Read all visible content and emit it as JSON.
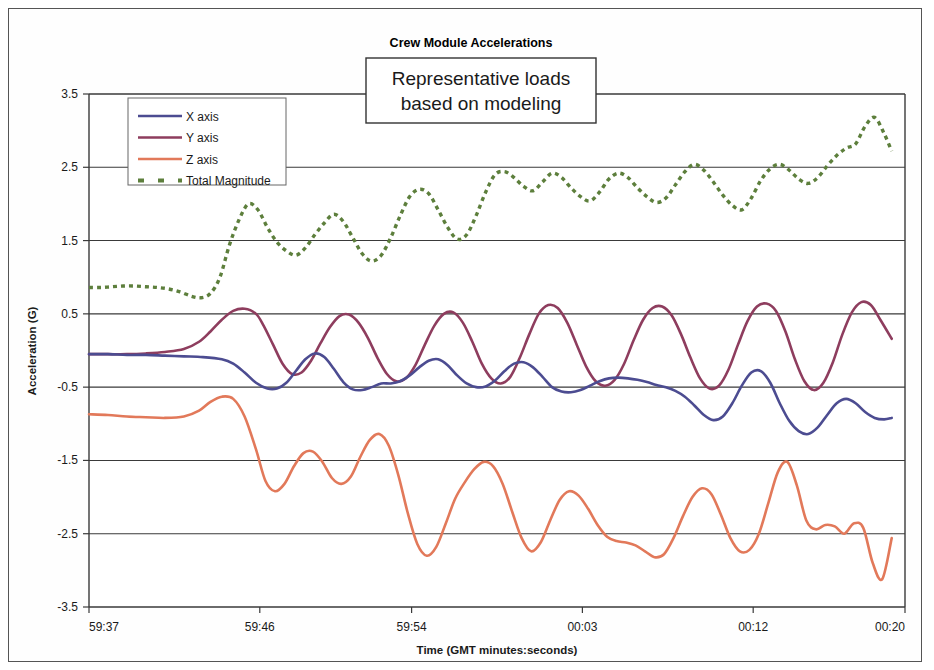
{
  "chart_data": {
    "type": "line",
    "title": "Crew Module Accelerations",
    "annotation": {
      "line1": "Representative loads",
      "line2": "based on modeling"
    },
    "xlabel": "Time (GMT minutes:seconds)",
    "ylabel": "Acceleration (G)",
    "ylim": [
      -3.5,
      3.5
    ],
    "ytick_labels": [
      "3.5",
      "2.5",
      "1.5",
      "0.5",
      "-0.5",
      "-1.5",
      "-2.5",
      "-3.5"
    ],
    "ytick_values": [
      3.5,
      2.5,
      1.5,
      0.5,
      -0.5,
      -1.5,
      -2.5,
      -3.5
    ],
    "xtick_labels": [
      "59:37",
      "59:46",
      "59:54",
      "00:03",
      "00:12",
      "00:20"
    ],
    "xtick_values": [
      0,
      9,
      17,
      26,
      35,
      43
    ],
    "xlim": [
      0,
      43
    ],
    "grid": true,
    "legend_position": "top-left-inside",
    "colors": {
      "x_axis": "#4c4c91",
      "y_axis": "#8e3d5e",
      "z_axis": "#e2795a",
      "total_magnitude": "#5d7f3c",
      "gridline": "#3a3a3a",
      "background": "#ffffff"
    },
    "series": [
      {
        "name": "X axis",
        "color": "#4c4c91",
        "style": "solid",
        "x": [
          0.0,
          1.0,
          2.0,
          3.0,
          4.0,
          5.0,
          6.0,
          7.0,
          7.6,
          8.2,
          8.8,
          9.4,
          9.9,
          10.4,
          10.9,
          11.4,
          11.9,
          12.4,
          12.9,
          13.4,
          13.9,
          14.4,
          14.9,
          15.4,
          15.9,
          16.4,
          16.9,
          17.4,
          17.9,
          18.4,
          18.9,
          19.4,
          19.9,
          20.4,
          20.9,
          21.4,
          21.9,
          22.4,
          22.9,
          23.4,
          23.9,
          24.4,
          24.9,
          25.4,
          25.9,
          26.4,
          26.9,
          27.4,
          27.9,
          28.4,
          28.9,
          29.4,
          29.9,
          30.4,
          30.9,
          31.4,
          31.9,
          32.4,
          32.9,
          33.4,
          33.9,
          34.4,
          34.9,
          35.4,
          35.9,
          36.4,
          36.9,
          37.4,
          37.9,
          38.4,
          38.9,
          39.4,
          39.9,
          40.4,
          40.9,
          41.4,
          41.9,
          42.3
        ],
        "y": [
          -0.05,
          -0.05,
          -0.06,
          -0.06,
          -0.07,
          -0.08,
          -0.09,
          -0.12,
          -0.18,
          -0.3,
          -0.44,
          -0.52,
          -0.52,
          -0.44,
          -0.28,
          -0.12,
          -0.04,
          -0.09,
          -0.25,
          -0.43,
          -0.53,
          -0.54,
          -0.5,
          -0.45,
          -0.45,
          -0.42,
          -0.34,
          -0.23,
          -0.14,
          -0.12,
          -0.2,
          -0.34,
          -0.45,
          -0.5,
          -0.49,
          -0.41,
          -0.28,
          -0.18,
          -0.16,
          -0.23,
          -0.36,
          -0.5,
          -0.56,
          -0.57,
          -0.54,
          -0.48,
          -0.42,
          -0.38,
          -0.37,
          -0.38,
          -0.4,
          -0.43,
          -0.47,
          -0.5,
          -0.55,
          -0.63,
          -0.75,
          -0.88,
          -0.95,
          -0.9,
          -0.72,
          -0.48,
          -0.3,
          -0.28,
          -0.44,
          -0.72,
          -0.96,
          -1.1,
          -1.14,
          -1.05,
          -0.88,
          -0.72,
          -0.66,
          -0.72,
          -0.84,
          -0.92,
          -0.94,
          -0.92
        ]
      },
      {
        "name": "Y axis",
        "color": "#8e3d5e",
        "style": "solid",
        "x": [
          0.0,
          1.0,
          2.0,
          3.0,
          4.0,
          5.0,
          5.8,
          6.4,
          7.0,
          7.6,
          8.2,
          8.8,
          9.2,
          9.7,
          10.2,
          10.7,
          11.2,
          11.7,
          12.2,
          12.7,
          13.2,
          13.7,
          14.2,
          14.7,
          15.2,
          15.7,
          16.2,
          16.7,
          17.2,
          17.7,
          18.2,
          18.7,
          19.2,
          19.7,
          20.2,
          20.7,
          21.2,
          21.7,
          22.2,
          22.7,
          23.2,
          23.7,
          24.2,
          24.7,
          25.2,
          25.7,
          26.2,
          26.7,
          27.2,
          27.7,
          28.2,
          28.7,
          29.2,
          29.7,
          30.2,
          30.7,
          31.2,
          31.7,
          32.2,
          32.7,
          33.2,
          33.7,
          34.2,
          34.7,
          35.2,
          35.7,
          36.2,
          36.7,
          37.2,
          37.7,
          38.2,
          38.7,
          39.2,
          39.7,
          40.2,
          40.7,
          41.2,
          41.7,
          42.3
        ],
        "y": [
          -0.05,
          -0.05,
          -0.05,
          -0.04,
          -0.02,
          0.02,
          0.12,
          0.26,
          0.42,
          0.54,
          0.57,
          0.5,
          0.34,
          0.08,
          -0.18,
          -0.32,
          -0.3,
          -0.14,
          0.1,
          0.32,
          0.47,
          0.49,
          0.38,
          0.17,
          -0.1,
          -0.32,
          -0.42,
          -0.38,
          -0.2,
          0.08,
          0.34,
          0.5,
          0.52,
          0.38,
          0.12,
          -0.18,
          -0.38,
          -0.45,
          -0.36,
          -0.1,
          0.22,
          0.5,
          0.62,
          0.58,
          0.38,
          0.08,
          -0.22,
          -0.42,
          -0.48,
          -0.4,
          -0.18,
          0.14,
          0.42,
          0.58,
          0.6,
          0.48,
          0.22,
          -0.1,
          -0.38,
          -0.52,
          -0.48,
          -0.26,
          0.08,
          0.4,
          0.6,
          0.64,
          0.54,
          0.26,
          -0.12,
          -0.42,
          -0.54,
          -0.44,
          -0.16,
          0.22,
          0.52,
          0.66,
          0.62,
          0.42,
          0.16
        ]
      },
      {
        "name": "Z axis",
        "color": "#e2795a",
        "style": "solid",
        "x": [
          0.0,
          1.0,
          2.0,
          3.0,
          4.0,
          5.0,
          5.8,
          6.4,
          7.0,
          7.6,
          8.2,
          8.8,
          9.3,
          9.8,
          10.3,
          10.8,
          11.3,
          11.8,
          12.3,
          12.8,
          13.3,
          13.8,
          14.3,
          14.8,
          15.3,
          15.8,
          16.3,
          16.8,
          17.3,
          17.8,
          18.3,
          18.8,
          19.3,
          19.8,
          20.3,
          20.8,
          21.3,
          21.8,
          22.3,
          22.8,
          23.3,
          23.8,
          24.3,
          24.8,
          25.3,
          25.8,
          26.3,
          26.8,
          27.3,
          27.8,
          28.3,
          28.8,
          29.3,
          29.8,
          30.3,
          30.8,
          31.3,
          31.8,
          32.3,
          32.8,
          33.3,
          33.8,
          34.3,
          34.8,
          35.3,
          35.8,
          36.3,
          36.8,
          37.3,
          37.8,
          38.3,
          38.8,
          39.3,
          39.8,
          40.3,
          40.8,
          41.3,
          41.8,
          42.3
        ],
        "y": [
          -0.87,
          -0.88,
          -0.9,
          -0.91,
          -0.92,
          -0.9,
          -0.82,
          -0.7,
          -0.63,
          -0.66,
          -0.9,
          -1.35,
          -1.78,
          -1.92,
          -1.82,
          -1.58,
          -1.4,
          -1.38,
          -1.52,
          -1.74,
          -1.82,
          -1.72,
          -1.45,
          -1.22,
          -1.14,
          -1.3,
          -1.7,
          -2.22,
          -2.64,
          -2.8,
          -2.68,
          -2.36,
          -2.02,
          -1.8,
          -1.62,
          -1.52,
          -1.58,
          -1.82,
          -2.2,
          -2.56,
          -2.74,
          -2.62,
          -2.32,
          -2.04,
          -1.92,
          -1.98,
          -2.16,
          -2.38,
          -2.54,
          -2.6,
          -2.62,
          -2.66,
          -2.74,
          -2.82,
          -2.78,
          -2.56,
          -2.26,
          -2.0,
          -1.88,
          -1.96,
          -2.24,
          -2.56,
          -2.74,
          -2.72,
          -2.5,
          -2.08,
          -1.66,
          -1.52,
          -1.84,
          -2.32,
          -2.44,
          -2.38,
          -2.4,
          -2.5,
          -2.36,
          -2.42,
          -2.9,
          -3.12,
          -2.56
        ]
      },
      {
        "name": "Total Magnitude",
        "color": "#5d7f3c",
        "style": "dotted",
        "x": [
          0.0,
          0.6,
          1.2,
          1.8,
          2.4,
          3.0,
          3.6,
          4.2,
          4.8,
          5.4,
          5.9,
          6.4,
          6.9,
          7.4,
          7.9,
          8.4,
          8.9,
          9.4,
          9.9,
          10.4,
          10.9,
          11.4,
          11.9,
          12.4,
          12.9,
          13.4,
          13.9,
          14.4,
          14.9,
          15.4,
          15.9,
          16.4,
          16.9,
          17.4,
          17.9,
          18.4,
          18.9,
          19.4,
          19.9,
          20.4,
          20.9,
          21.4,
          21.9,
          22.4,
          22.9,
          23.4,
          23.9,
          24.4,
          24.9,
          25.4,
          25.9,
          26.4,
          26.9,
          27.4,
          27.9,
          28.4,
          28.9,
          29.4,
          29.9,
          30.4,
          30.9,
          31.4,
          31.9,
          32.4,
          32.9,
          33.4,
          33.9,
          34.4,
          34.9,
          35.4,
          35.9,
          36.4,
          36.9,
          37.4,
          37.9,
          38.4,
          38.9,
          39.4,
          39.9,
          40.4,
          40.9,
          41.4,
          41.9,
          42.3
        ],
        "y": [
          0.86,
          0.86,
          0.87,
          0.88,
          0.88,
          0.87,
          0.86,
          0.84,
          0.8,
          0.74,
          0.72,
          0.78,
          1.0,
          1.44,
          1.78,
          2.0,
          1.92,
          1.68,
          1.48,
          1.36,
          1.3,
          1.4,
          1.58,
          1.74,
          1.86,
          1.76,
          1.54,
          1.32,
          1.22,
          1.3,
          1.54,
          1.84,
          2.1,
          2.2,
          2.14,
          1.92,
          1.68,
          1.52,
          1.58,
          1.84,
          2.16,
          2.4,
          2.44,
          2.36,
          2.24,
          2.18,
          2.3,
          2.42,
          2.36,
          2.22,
          2.1,
          2.04,
          2.16,
          2.34,
          2.42,
          2.36,
          2.22,
          2.1,
          2.02,
          2.08,
          2.26,
          2.44,
          2.54,
          2.46,
          2.3,
          2.12,
          1.98,
          1.92,
          2.08,
          2.32,
          2.48,
          2.54,
          2.46,
          2.34,
          2.28,
          2.36,
          2.52,
          2.66,
          2.76,
          2.82,
          3.06,
          3.18,
          2.96,
          2.72
        ]
      }
    ]
  },
  "legend": {
    "items": [
      {
        "label": "X axis",
        "color": "#4c4c91",
        "style": "solid"
      },
      {
        "label": "Y axis",
        "color": "#8e3d5e",
        "style": "solid"
      },
      {
        "label": "Z axis",
        "color": "#e2795a",
        "style": "solid"
      },
      {
        "label": "Total Magnitude",
        "color": "#5d7f3c",
        "style": "dotted"
      }
    ]
  }
}
